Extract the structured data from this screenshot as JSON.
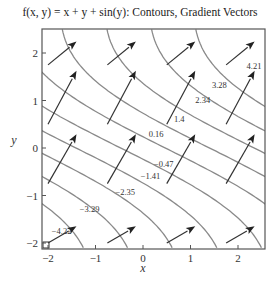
{
  "chart_data": {
    "type": "contour",
    "title": "f(x, y) = x + y + sin(y): Contours, Gradient Vectors",
    "function": "x + y + sin(y)",
    "xlabel": "x",
    "ylabel": "y",
    "xlim": [
      -2.1,
      2.6
    ],
    "ylim": [
      -2.1,
      2.5
    ],
    "xticks": [
      -2,
      -1,
      0,
      1,
      2
    ],
    "yticks": [
      -2,
      -1,
      0,
      1,
      2
    ],
    "grid": false,
    "contour_levels": [
      -4.22,
      -3.29,
      -2.35,
      -1.41,
      -0.47,
      0.47,
      1.4,
      2.34,
      3.28,
      4.21
    ],
    "contour_labels": [
      {
        "text": "-4.22",
        "x": -1.92,
        "y": -1.74
      },
      {
        "text": "-3.29",
        "x": -1.33,
        "y": -1.28
      },
      {
        "text": "-2.35",
        "x": -0.58,
        "y": -0.93
      },
      {
        "text": "-1.41",
        "x": -0.05,
        "y": -0.58
      },
      {
        "text": "-0.47",
        "x": 0.23,
        "y": -0.34
      },
      {
        "text": "0.16",
        "x": 0.12,
        "y": 0.3
      },
      {
        "text": "1.4",
        "x": 0.65,
        "y": 0.61
      },
      {
        "text": "2.34",
        "x": 1.1,
        "y": 1.02
      },
      {
        "text": "3.28",
        "x": 1.45,
        "y": 1.33
      },
      {
        "text": "4.21",
        "x": 2.18,
        "y": 1.73
      }
    ],
    "vector_field": {
      "gradient": "(1, 1 + cos(y))",
      "grid_x": [
        -2,
        -0.75,
        0.5,
        1.75
      ],
      "grid_y": [
        -2,
        -0.75,
        0.5,
        1.75
      ],
      "scale": 0.6
    }
  },
  "title": "f(x, y) = x + y + sin(y): Contours, Gradient Vectors",
  "axes": {
    "x_label": "x",
    "y_label": "y",
    "x_tick_labels": [
      "−2",
      "−1",
      "0",
      "1",
      "2"
    ],
    "y_tick_labels": [
      "−2",
      "−1",
      "0",
      "1",
      "2"
    ]
  }
}
